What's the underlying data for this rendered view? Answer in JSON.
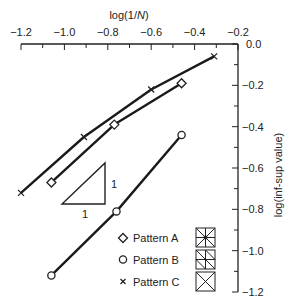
{
  "chart_data": {
    "type": "line",
    "title": "",
    "xlabel": "log(1/N)",
    "xlabel_parts": {
      "prefix": "log(1/",
      "italic": "N",
      "suffix": ")"
    },
    "ylabel": "log(inf-sup value)",
    "xlim": [
      -1.2,
      -0.2
    ],
    "ylim": [
      -1.2,
      0.0
    ],
    "x_axis_position": "top",
    "y_axis_position": "right",
    "grid": false,
    "x_ticks": [
      -1.2,
      -1.0,
      -0.8,
      -0.6,
      -0.4,
      -0.2
    ],
    "x_tick_labels": [
      "−1.2",
      "−1.0",
      "−0.8",
      "−0.6",
      "−0.4",
      "−0.2"
    ],
    "y_ticks": [
      0.0,
      -0.2,
      -0.4,
      -0.6,
      -0.8,
      -1.0,
      -1.2
    ],
    "y_tick_labels": [
      "0.0",
      "−0.2",
      "−0.4",
      "−0.6",
      "−0.8",
      "−1.0",
      "−1.2"
    ],
    "series": [
      {
        "name": "Pattern A",
        "marker": "diamond",
        "x": [
          -1.06,
          -0.77,
          -0.46
        ],
        "y": [
          -0.67,
          -0.39,
          -0.19
        ]
      },
      {
        "name": "Pattern B",
        "marker": "circle",
        "x": [
          -1.06,
          -0.76,
          -0.46
        ],
        "y": [
          -1.12,
          -0.81,
          -0.44
        ]
      },
      {
        "name": "Pattern C",
        "marker": "cross",
        "x": [
          -1.2,
          -0.91,
          -0.6,
          -0.31
        ],
        "y": [
          -0.72,
          -0.45,
          -0.22,
          -0.06
        ]
      }
    ],
    "annotations": [
      {
        "type": "slope-triangle",
        "horizontal_label": "1",
        "vertical_label": "1"
      }
    ],
    "legend": {
      "position": "lower-right",
      "entries": [
        {
          "label": "Pattern A",
          "marker": "diamond",
          "pattern_icon": "mesh-union-jack"
        },
        {
          "label": "Pattern B",
          "marker": "circle",
          "pattern_icon": "mesh-uniform-diagonal"
        },
        {
          "label": "Pattern C",
          "marker": "cross",
          "pattern_icon": "mesh-crossed"
        }
      ]
    }
  },
  "legend": {
    "a": "Pattern A",
    "b": "Pattern B",
    "c": "Pattern C"
  },
  "slope": {
    "run": "1",
    "rise": "1"
  }
}
